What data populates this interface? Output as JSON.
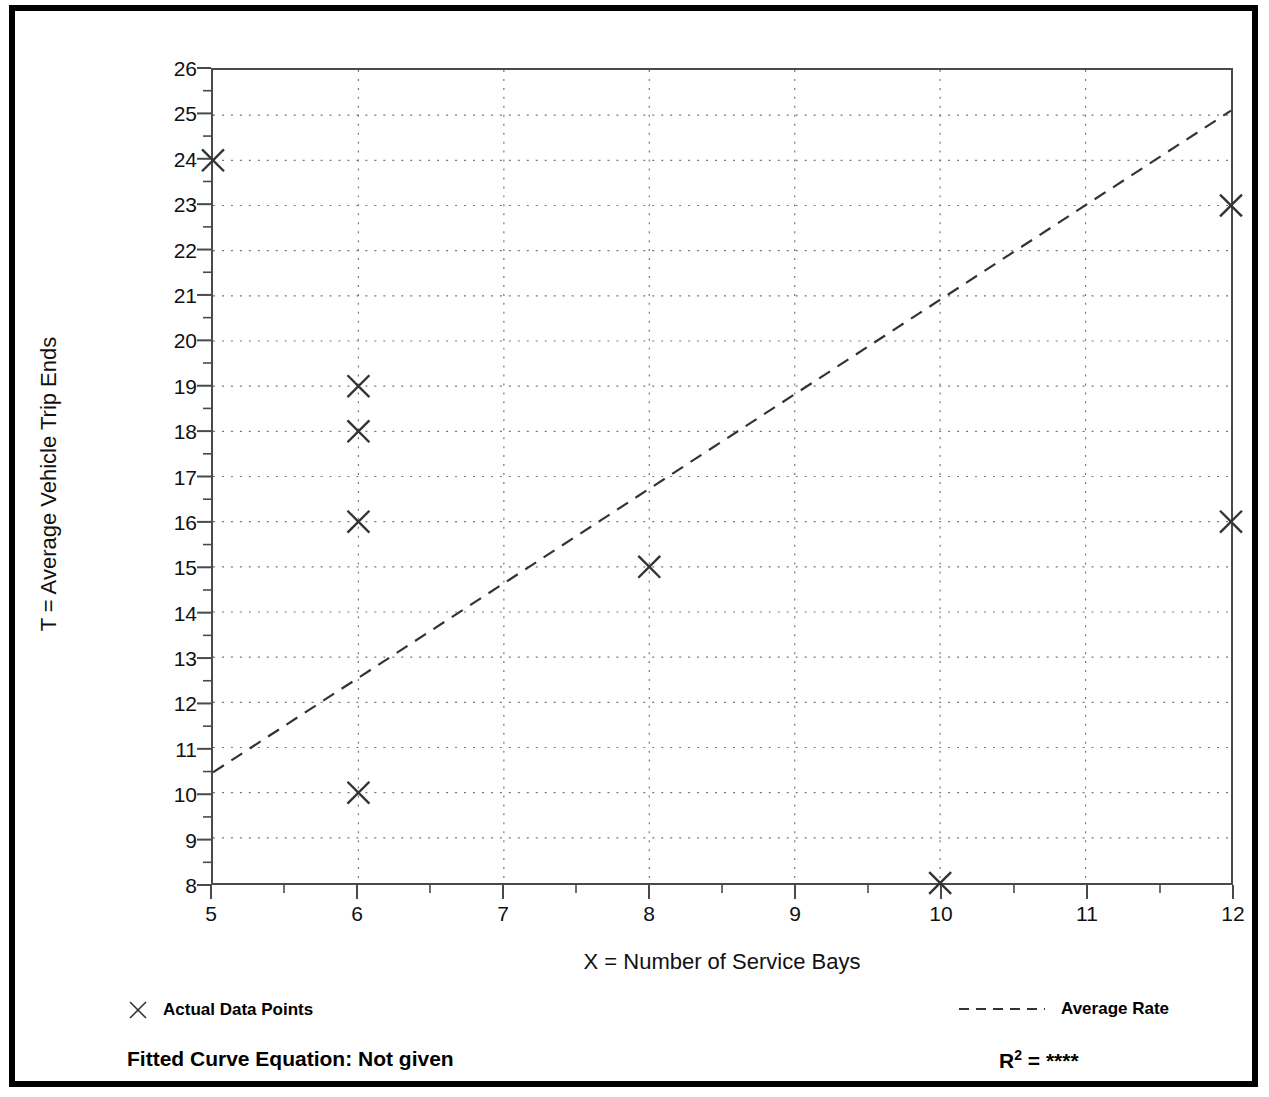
{
  "chart_data": {
    "type": "scatter",
    "title": "",
    "xlabel": "X = Number of Service Bays",
    "ylabel": "T = Average Vehicle Trip Ends",
    "xlim": [
      5,
      12
    ],
    "ylim": [
      8,
      26
    ],
    "xticks": [
      5,
      6,
      7,
      8,
      9,
      10,
      11,
      12
    ],
    "yticks": [
      8,
      9,
      10,
      11,
      12,
      13,
      14,
      15,
      16,
      17,
      18,
      19,
      20,
      21,
      22,
      23,
      24,
      25,
      26
    ],
    "minor_tick_step": 0.5,
    "grid": true,
    "grid_style": "dotted",
    "legend_position": "below-plot",
    "series": [
      {
        "name": "Actual Data Points",
        "type": "scatter",
        "marker": "x",
        "points": [
          {
            "x": 5,
            "y": 24
          },
          {
            "x": 6,
            "y": 19
          },
          {
            "x": 6,
            "y": 18
          },
          {
            "x": 6,
            "y": 16
          },
          {
            "x": 6,
            "y": 10
          },
          {
            "x": 8,
            "y": 15
          },
          {
            "x": 10,
            "y": 8
          },
          {
            "x": 12,
            "y": 23
          },
          {
            "x": 12,
            "y": 16
          }
        ]
      },
      {
        "name": "Average Rate",
        "type": "line",
        "style": "dashed",
        "points": [
          {
            "x": 5,
            "y": 10.45
          },
          {
            "x": 12,
            "y": 25.1
          }
        ]
      }
    ],
    "annotations": {
      "fitted_curve_equation_label": "Fitted Curve Equation:",
      "fitted_curve_equation_value": "Not given",
      "r_squared_label": "R",
      "r_squared_exponent": "2",
      "r_squared_equals": "=",
      "r_squared_value": "****"
    },
    "colors": {
      "axis": "#4a4a4a",
      "grid": "#777777",
      "marker": "#333333",
      "line": "#333333",
      "frame": "#000000",
      "text": "#111111"
    }
  },
  "axes": {
    "y_title": "T = Average Vehicle Trip Ends",
    "x_title": "X = Number of Service Bays",
    "y_tick_labels": [
      "26",
      "25",
      "24",
      "23",
      "22",
      "21",
      "20",
      "19",
      "18",
      "17",
      "16",
      "15",
      "14",
      "13",
      "12",
      "11",
      "10",
      "9",
      "8"
    ],
    "x_tick_labels": [
      "5",
      "6",
      "7",
      "8",
      "9",
      "10",
      "11",
      "12"
    ]
  },
  "legend": {
    "actual_data_points": "Actual Data Points",
    "average_rate": "Average Rate"
  },
  "footer": {
    "fitted_curve_equation": "Fitted Curve Equation:  Not given",
    "r2_label": "R",
    "r2_sup": "2",
    "r2_eq": " = ",
    "r2_value": "****"
  }
}
